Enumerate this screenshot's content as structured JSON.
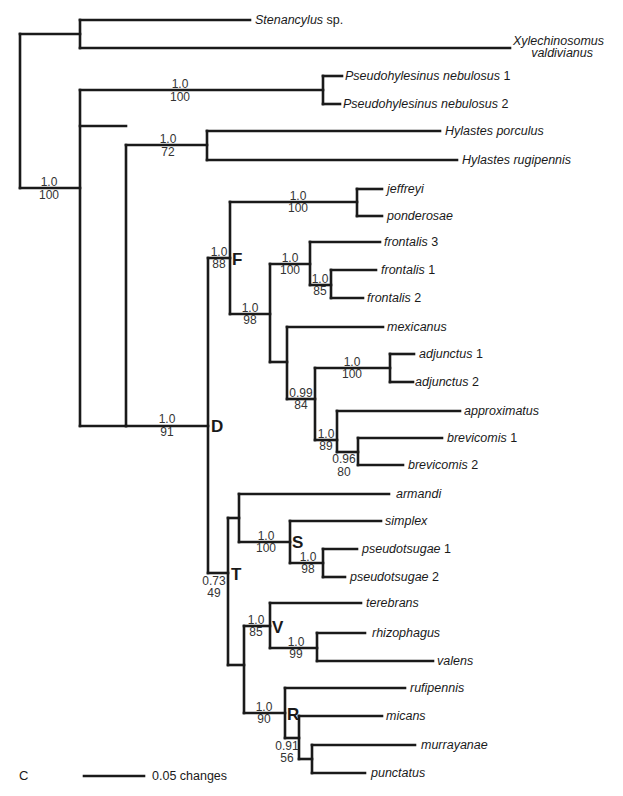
{
  "figure": {
    "panel_label": "C",
    "scale_bar": {
      "label": "0.05 changes"
    }
  },
  "taxa": [
    {
      "id": "stenancylus",
      "genus": "Stenancylus",
      "suffix": " sp."
    },
    {
      "id": "xylechinosomus",
      "line1": "Xylechinosomus",
      "line2": "valdivianus"
    },
    {
      "id": "pseudo1",
      "genus": "Pseudohylesinus nebulosus",
      "suffix": " 1"
    },
    {
      "id": "pseudo2",
      "genus": "Pseudohylesinus nebulosus",
      "suffix": " 2"
    },
    {
      "id": "porculus",
      "genus": "Hylastes porculus",
      "suffix": ""
    },
    {
      "id": "rugipennis",
      "genus": "Hylastes rugipennis",
      "suffix": ""
    },
    {
      "id": "jeffreyi",
      "genus": "jeffreyi",
      "suffix": ""
    },
    {
      "id": "ponderosae",
      "genus": "ponderosae",
      "suffix": ""
    },
    {
      "id": "frontalis3",
      "genus": "frontalis",
      "suffix": " 3"
    },
    {
      "id": "frontalis1",
      "genus": "frontalis",
      "suffix": " 1"
    },
    {
      "id": "frontalis2",
      "genus": "frontalis",
      "suffix": " 2"
    },
    {
      "id": "mexicanus",
      "genus": "mexicanus",
      "suffix": ""
    },
    {
      "id": "adjunctus1",
      "genus": "adjunctus",
      "suffix": " 1"
    },
    {
      "id": "adjunctus2",
      "genus": "adjunctus",
      "suffix": " 2"
    },
    {
      "id": "approximatus",
      "genus": "approximatus",
      "suffix": ""
    },
    {
      "id": "brevicomis1",
      "genus": "brevicomis",
      "suffix": " 1"
    },
    {
      "id": "brevicomis2",
      "genus": "brevicomis",
      "suffix": " 2"
    },
    {
      "id": "armandi",
      "genus": "armandi",
      "suffix": ""
    },
    {
      "id": "simplex",
      "genus": "simplex",
      "suffix": ""
    },
    {
      "id": "pseudotsugae1",
      "genus": "pseudotsugae",
      "suffix": " 1"
    },
    {
      "id": "pseudotsugae2",
      "genus": "pseudotsugae",
      "suffix": " 2"
    },
    {
      "id": "terebrans",
      "genus": "terebrans",
      "suffix": ""
    },
    {
      "id": "rhizophagus",
      "genus": "rhizophagus",
      "suffix": ""
    },
    {
      "id": "valens",
      "genus": "valens",
      "suffix": ""
    },
    {
      "id": "rufipennis",
      "genus": "rufipennis",
      "suffix": ""
    },
    {
      "id": "micans",
      "genus": "micans",
      "suffix": ""
    },
    {
      "id": "murrayanae",
      "genus": "murrayanae",
      "suffix": ""
    },
    {
      "id": "punctatus",
      "genus": "punctatus",
      "suffix": ""
    }
  ],
  "support": [
    {
      "node": "root-ingroup",
      "posterior": "1.0",
      "bootstrap": "100"
    },
    {
      "node": "pseudohylesinus",
      "posterior": "1.0",
      "bootstrap": "100"
    },
    {
      "node": "hylastes",
      "posterior": "1.0",
      "bootstrap": "72"
    },
    {
      "node": "dendroctonus",
      "posterior": "1.0",
      "bootstrap": "91"
    },
    {
      "node": "clade-F",
      "posterior": "1.0",
      "bootstrap": "88"
    },
    {
      "node": "jeffreyi-ponderosae",
      "posterior": "1.0",
      "bootstrap": "100"
    },
    {
      "node": "frontalis-group",
      "posterior": "1.0",
      "bootstrap": "98"
    },
    {
      "node": "frontalis-clade",
      "posterior": "1.0",
      "bootstrap": "100"
    },
    {
      "node": "frontalis1-2",
      "posterior": "1.0",
      "bootstrap": "85"
    },
    {
      "node": "adjunctus",
      "posterior": "1.0",
      "bootstrap": "100"
    },
    {
      "node": "adj-brev",
      "posterior": "0.99",
      "bootstrap": "84"
    },
    {
      "node": "approx-brev",
      "posterior": "1.0",
      "bootstrap": "89"
    },
    {
      "node": "brevicomis",
      "posterior": "0.96",
      "bootstrap": "80"
    },
    {
      "node": "clade-S",
      "posterior": "1.0",
      "bootstrap": "100"
    },
    {
      "node": "pseudotsugae",
      "posterior": "1.0",
      "bootstrap": "98"
    },
    {
      "node": "clade-T",
      "posterior": "0.73",
      "bootstrap": "49"
    },
    {
      "node": "clade-V",
      "posterior": "1.0",
      "bootstrap": "85"
    },
    {
      "node": "rhizo-valens",
      "posterior": "1.0",
      "bootstrap": "99"
    },
    {
      "node": "clade-R",
      "posterior": "1.0",
      "bootstrap": "90"
    },
    {
      "node": "micans-group",
      "posterior": "0.91",
      "bootstrap": "56"
    }
  ],
  "clade_labels": {
    "D": "D",
    "F": "F",
    "S": "S",
    "T": "T",
    "V": "V",
    "R": "R"
  }
}
